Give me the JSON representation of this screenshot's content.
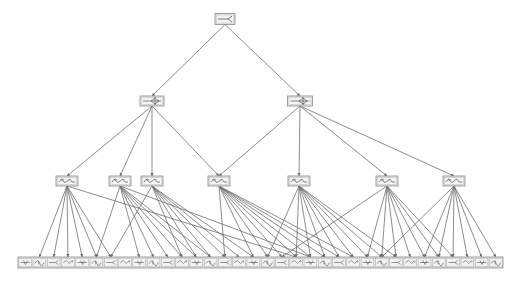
{
  "diagram": {
    "type": "tree",
    "colors": {
      "node_fill": "#e6e6e6",
      "node_stroke": "#8a8a8a",
      "edge": "#6e6e6e",
      "glyph": "#555555",
      "background": "#ffffff"
    },
    "root": {
      "id": "r",
      "x": 225,
      "y": 19,
      "w": 20,
      "h": 11,
      "glyph": "fork"
    },
    "level1": [
      {
        "id": "a",
        "x": 152,
        "y": 101,
        "w": 24,
        "h": 10,
        "glyph": "arrow-diamond"
      },
      {
        "id": "b",
        "x": 300,
        "y": 101,
        "w": 25,
        "h": 10,
        "glyph": "arrow-diamond"
      }
    ],
    "level2": [
      {
        "id": "c1",
        "x": 67,
        "y": 181,
        "w": 22,
        "h": 10,
        "glyph": "squiggle"
      },
      {
        "id": "c2",
        "x": 120,
        "y": 181,
        "w": 22,
        "h": 10,
        "glyph": "squiggle"
      },
      {
        "id": "c3",
        "x": 152,
        "y": 181,
        "w": 22,
        "h": 10,
        "glyph": "squiggle"
      },
      {
        "id": "c4",
        "x": 219,
        "y": 181,
        "w": 22,
        "h": 10,
        "glyph": "squiggle"
      },
      {
        "id": "c5",
        "x": 299,
        "y": 181,
        "w": 22,
        "h": 10,
        "glyph": "squiggle"
      },
      {
        "id": "c6",
        "x": 387,
        "y": 181,
        "w": 22,
        "h": 10,
        "glyph": "squiggle"
      },
      {
        "id": "c7",
        "x": 454,
        "y": 181,
        "w": 22,
        "h": 10,
        "glyph": "squiggle"
      }
    ],
    "leaf_row": {
      "y": 257,
      "h": 11,
      "x_start": 18,
      "x_end": 503,
      "count": 34
    },
    "edges_root": [
      "a",
      "b"
    ],
    "edges_l1": {
      "a": [
        "c1",
        "c2",
        "c3",
        "c4"
      ],
      "b": [
        "c4",
        "c5",
        "c6",
        "c7"
      ]
    },
    "edges_l2": {
      "c1": [
        1,
        2,
        3,
        4,
        5,
        6,
        19
      ],
      "c2": [
        5,
        8,
        9,
        10,
        11,
        12,
        13,
        20
      ],
      "c3": [
        6,
        11,
        12,
        13,
        14,
        15,
        16
      ],
      "c4": [
        14,
        16,
        17,
        18,
        19,
        20,
        21,
        22,
        23
      ],
      "c5": [
        17,
        19,
        20,
        21,
        22,
        23,
        24,
        25,
        26
      ],
      "c6": [
        18,
        24,
        25,
        26,
        27,
        28,
        29,
        30
      ],
      "c7": [
        25,
        28,
        29,
        30,
        31,
        32,
        33
      ]
    }
  }
}
